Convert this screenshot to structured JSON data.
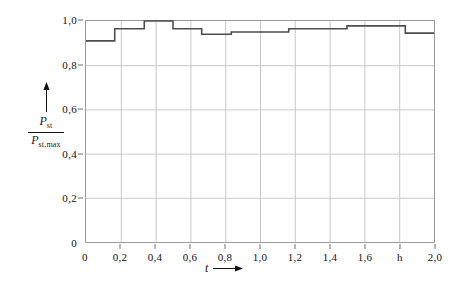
{
  "chart_data": {
    "type": "line",
    "subtype": "step",
    "title": "",
    "xlabel": "t",
    "ylabel": "P_st / P_st,max",
    "ylabel_numerator": "P",
    "ylabel_numerator_sub": "st",
    "ylabel_denominator": "P",
    "ylabel_denominator_sub": "st,max",
    "xlim": [
      0,
      2.0
    ],
    "ylim": [
      0,
      1.0
    ],
    "grid": true,
    "legend": null,
    "x_tick_labels": [
      "0",
      "0,2",
      "0,4",
      "0,6",
      "0,8",
      "1,0",
      "1,2",
      "1,4",
      "1,6",
      "h",
      "2,0"
    ],
    "x_tick_values": [
      0,
      0.2,
      0.4,
      0.6,
      0.8,
      1.0,
      1.2,
      1.4,
      1.6,
      1.8,
      2.0
    ],
    "y_tick_labels": [
      "0",
      "0,2",
      "0,4",
      "0,6",
      "0,8",
      "1,0"
    ],
    "y_tick_values": [
      0,
      0.2,
      0.4,
      0.6,
      0.8,
      1.0
    ],
    "x_unit_label": "h",
    "series_color": "#4d4d4d",
    "grid_color": "#c8c8c8",
    "frame_color": "#9a9a9a",
    "steps": [
      {
        "x_start": 0.0,
        "x_end": 0.165,
        "y": 0.91
      },
      {
        "x_start": 0.165,
        "x_end": 0.335,
        "y": 0.965
      },
      {
        "x_start": 0.335,
        "x_end": 0.5,
        "y": 1.0
      },
      {
        "x_start": 0.5,
        "x_end": 0.665,
        "y": 0.965
      },
      {
        "x_start": 0.665,
        "x_end": 0.835,
        "y": 0.94
      },
      {
        "x_start": 0.835,
        "x_end": 1.165,
        "y": 0.95
      },
      {
        "x_start": 1.165,
        "x_end": 1.5,
        "y": 0.965
      },
      {
        "x_start": 1.5,
        "x_end": 1.835,
        "y": 0.978
      },
      {
        "x_start": 1.835,
        "x_end": 2.0,
        "y": 0.945
      }
    ]
  }
}
